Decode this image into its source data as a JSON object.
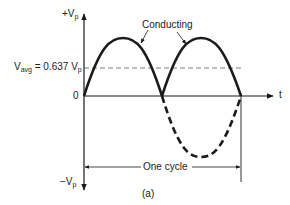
{
  "diagram": {
    "type": "half-wave rectified sine waveform",
    "y_axis": {
      "top_label": "+V",
      "top_label_sub": "p",
      "bottom_label": "−V",
      "bottom_label_sub": "p",
      "zero_label": "0"
    },
    "x_axis": {
      "label": "t"
    },
    "average_line": {
      "label_prefix": "V",
      "label_prefix_sub": "avg",
      "label_mid": " = 0.637 V",
      "label_suffix_sub": "p"
    },
    "annotation": "Conducting",
    "cycle_label": "One cycle",
    "caption": "(a)",
    "colors": {
      "line": "#1a1a1a",
      "dashed_avg": "#555555",
      "background": "#ffffff"
    }
  }
}
